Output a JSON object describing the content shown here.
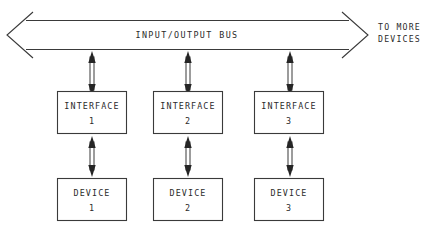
{
  "diagram": {
    "background_color": "#ffffff",
    "line_color": "#3a3a3a",
    "text_color": "#2b2b2b",
    "bus": {
      "label": "INPUT/OUTPUT BUS",
      "left_arrow_direction": "left",
      "right_arrow_direction": "right"
    },
    "side_note": {
      "line1": "TO MORE",
      "line2": "DEVICES"
    },
    "columns": [
      {
        "interface": {
          "name": "INTERFACE",
          "number": "1"
        },
        "device": {
          "name": "DEVICE",
          "number": "1"
        },
        "bus_link": "bidirectional",
        "device_link": "bidirectional"
      },
      {
        "interface": {
          "name": "INTERFACE",
          "number": "2"
        },
        "device": {
          "name": "DEVICE",
          "number": "2"
        },
        "bus_link": "bidirectional",
        "device_link": "bidirectional"
      },
      {
        "interface": {
          "name": "INTERFACE",
          "number": "3"
        },
        "device": {
          "name": "DEVICE",
          "number": "3"
        },
        "bus_link": "bidirectional",
        "device_link": "bidirectional"
      }
    ]
  }
}
